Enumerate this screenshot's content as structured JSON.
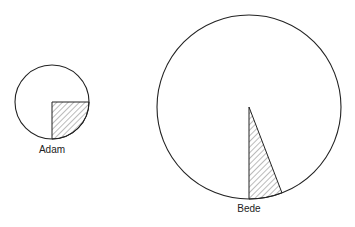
{
  "chart_data": {
    "type": "pie",
    "title": "",
    "series": [
      {
        "name": "Adam",
        "label": "Adam",
        "shaded_sector_degrees": 90,
        "shaded_fraction": 0.25,
        "relative_size": "small",
        "center": [
          52,
          102
        ],
        "radius": 37,
        "sector_start_deg": 0,
        "sector_end_deg": 90
      },
      {
        "name": "Bede",
        "label": "Bede",
        "shaded_sector_degrees": 21,
        "shaded_fraction": 0.058,
        "relative_size": "large",
        "center": [
          249,
          107
        ],
        "radius": 92,
        "sector_start_deg": 69,
        "sector_end_deg": 90
      }
    ],
    "colors": {
      "stroke": "#222222",
      "hatch": "#444444",
      "background": "#ffffff"
    }
  },
  "labels": {
    "adam": "Adam",
    "bede": "Bede"
  }
}
